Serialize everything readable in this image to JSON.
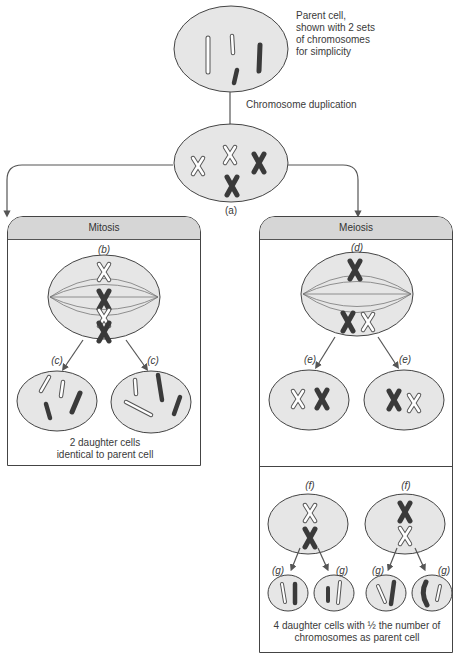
{
  "top": {
    "parent_note": [
      "Parent cell,",
      "shown with 2 sets",
      "of chromosomes",
      "for simplicity"
    ],
    "step_label": "Chromosome duplication",
    "duplicated_label": "(a)"
  },
  "mitosis": {
    "title": "Mitosis",
    "stage_b": "(b)",
    "stage_c_left": "(c)",
    "stage_c_right": "(c)",
    "caption": [
      "2 daughter cells",
      "identical to parent cell"
    ]
  },
  "meiosis": {
    "title": "Meiosis",
    "stage_d": "(d)",
    "stage_e_left": "(e)",
    "stage_e_right": "(e)",
    "stage_f_left": "(f)",
    "stage_f_right": "(f)",
    "stage_g": [
      "(g)",
      "(g)",
      "(g)",
      "(g)"
    ],
    "caption": [
      "4 daughter cells with ½ the number of",
      "chromosomes as parent cell"
    ]
  },
  "colors": {
    "cell_fill": "#e6e6e6",
    "outline": "#444444",
    "dark_chromosome": "#3a3a3a",
    "header_fill": "#d6d6d6",
    "arrow": "#555555"
  }
}
